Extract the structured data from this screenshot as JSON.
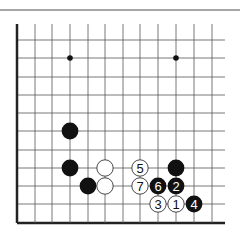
{
  "diagram": {
    "type": "go-board-fragment",
    "grid": {
      "columns": 12,
      "rows": 11,
      "col_x": [
        17,
        35,
        52,
        70,
        88,
        105,
        123,
        140,
        158,
        176,
        194,
        212
      ],
      "row_y": [
        40,
        58,
        77,
        95,
        113,
        131,
        150,
        168,
        186,
        204,
        223
      ],
      "line_top_y": 24,
      "line_right_x": 225,
      "top_border_y": 10,
      "left_edge_bold": true,
      "bottom_edge_bold": true
    },
    "colors": {
      "line": "#555555",
      "edge": "#222222",
      "top_border": "#888888",
      "black_stone": "#111111",
      "white_stone": "#ffffff",
      "white_stroke": "#333333"
    },
    "star_points": [
      {
        "col": 3,
        "row": 1
      },
      {
        "col": 9,
        "row": 1
      }
    ],
    "stones": [
      {
        "color": "black",
        "col": 3,
        "row": 5,
        "label": ""
      },
      {
        "color": "black",
        "col": 3,
        "row": 7,
        "label": ""
      },
      {
        "color": "black",
        "col": 4,
        "row": 8,
        "label": ""
      },
      {
        "color": "white",
        "col": 5,
        "row": 7,
        "label": ""
      },
      {
        "color": "white",
        "col": 5,
        "row": 8,
        "label": ""
      },
      {
        "color": "black",
        "col": 9,
        "row": 7,
        "label": ""
      },
      {
        "color": "white",
        "col": 7,
        "row": 7,
        "label": "5"
      },
      {
        "color": "white",
        "col": 7,
        "row": 8,
        "label": "7"
      },
      {
        "color": "black",
        "col": 8,
        "row": 8,
        "label": "6"
      },
      {
        "color": "black",
        "col": 9,
        "row": 8,
        "label": "2"
      },
      {
        "color": "white",
        "col": 8,
        "row": 9,
        "label": "3"
      },
      {
        "color": "white",
        "col": 9,
        "row": 9,
        "label": "1"
      },
      {
        "color": "black",
        "col": 10,
        "row": 9,
        "label": "4"
      }
    ]
  }
}
